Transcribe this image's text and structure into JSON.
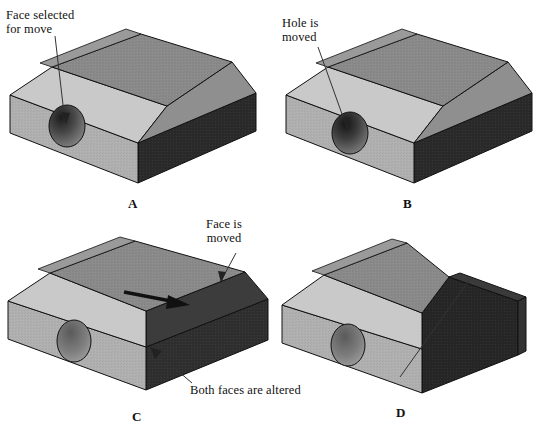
{
  "figure": {
    "type": "technical-illustration",
    "panel_count": 4,
    "background": "#ffffff"
  },
  "palette": {
    "top_face": "#8a8a8a",
    "chamfer_light": "#c9c9c9",
    "front_face": "#b0b0b0",
    "left_face": "#a2a2a2",
    "dark_face": "#2a2a2a",
    "dark_face_2": "#3a3a3a",
    "outline": "#111111",
    "leader": "#333333",
    "text": "#111111"
  },
  "panels": [
    {
      "id": "A",
      "letter": "A",
      "annotations": [
        {
          "name": "face-selected-note",
          "lines": [
            "Face selected",
            "for move"
          ],
          "text": "Face selected for move",
          "leader": "vertical-line-to-hole"
        }
      ]
    },
    {
      "id": "B",
      "letter": "B",
      "annotations": [
        {
          "name": "hole-moved-note",
          "lines": [
            "Hole is",
            "moved"
          ],
          "text": "Hole is moved",
          "leader": "diagonal-line-to-hole"
        }
      ]
    },
    {
      "id": "C",
      "letter": "C",
      "annotations": [
        {
          "name": "face-moved-note",
          "lines": [
            "Face is",
            "moved"
          ],
          "text": "Face is moved",
          "leader": "diagonal-arrow-to-top-right-edge"
        },
        {
          "name": "both-faces-altered-note",
          "lines": [
            "Both faces are altered"
          ],
          "text": "Both faces are altered",
          "leader": "diagonal-line-to-corner"
        },
        {
          "name": "move-direction-arrow",
          "lines": [],
          "text": "",
          "leader": "bold-horizontal-arrow"
        }
      ]
    },
    {
      "id": "D",
      "letter": "D",
      "annotations": [
        {
          "name": "angled-face-coplanar-note",
          "lines": [
            "Angled face",
            "is made coplanar",
            "with the vertical face"
          ],
          "text": "Angled face is made coplanar with the vertical face",
          "leader": "diagonal-line-to-angled-face"
        }
      ]
    }
  ]
}
